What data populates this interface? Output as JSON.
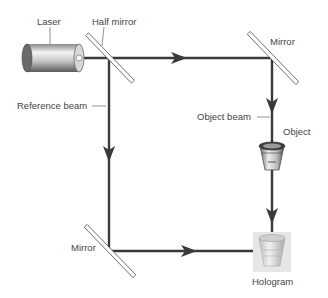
{
  "diagram": {
    "labels": {
      "laser": "Laser",
      "half_mirror": "Half mirror",
      "mirror_top": "Mirror",
      "reference_beam": "Reference beam",
      "object_beam": "Object beam",
      "object": "Object",
      "mirror_bottom": "Mirror",
      "hologram": "Hologram"
    },
    "colors": {
      "beam": "#3a3a3a",
      "label": "#444444",
      "mirror_fill": "#ffffff",
      "mirror_stroke": "#555555"
    }
  }
}
